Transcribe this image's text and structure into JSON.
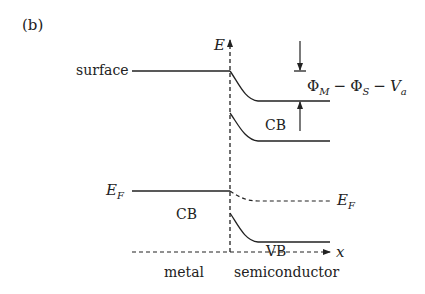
{
  "panel_label": "(b)",
  "axes": {
    "y_label": "E",
    "x_label": "x"
  },
  "metal": {
    "surface_label": "surface",
    "fermi_label_main": "E",
    "fermi_label_sub": "F",
    "band_label": "CB",
    "region_label": "metal"
  },
  "semiconductor": {
    "cb_label": "CB",
    "vb_label": "VB",
    "fermi_label_main": "E",
    "fermi_label_sub": "F",
    "region_label": "semiconductor"
  },
  "barrier": {
    "phi": "Φ",
    "sub_m": "M",
    "sub_s": "S",
    "minus": "−",
    "v": "V",
    "sub_a": "a"
  },
  "colors": {
    "line": "#222222"
  }
}
